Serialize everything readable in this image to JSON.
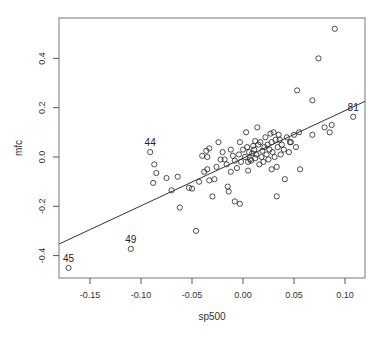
{
  "chart_data": {
    "type": "scatter",
    "title": "",
    "xlabel": "sp500",
    "ylabel": "mfc",
    "xlim": [
      -0.18,
      0.12
    ],
    "ylim": [
      -0.49,
      0.56
    ],
    "grid": false,
    "legend": null,
    "x_ticks": [
      -0.15,
      -0.1,
      -0.05,
      0.0,
      0.05,
      0.1
    ],
    "x_tick_labels": [
      "-0.15",
      "-0.10",
      "-0.05",
      "0.00",
      "0.05",
      "0.10"
    ],
    "y_ticks": [
      -0.4,
      -0.2,
      0.0,
      0.2,
      0.4
    ],
    "y_tick_labels": [
      "-0.4",
      "-0.2",
      "0.0",
      "0.2",
      "0.4"
    ],
    "regression_line": {
      "intercept": -0.005,
      "slope": 1.93,
      "x_range": [
        -0.18,
        0.12
      ]
    },
    "annotations": [
      {
        "label": "45",
        "x": -0.171,
        "y": -0.45
      },
      {
        "label": "49",
        "x": -0.11,
        "y": -0.373
      },
      {
        "label": "44",
        "x": -0.091,
        "y": 0.02
      },
      {
        "label": "81",
        "x": 0.108,
        "y": 0.163
      }
    ],
    "points": [
      [
        -0.171,
        -0.45
      ],
      [
        -0.11,
        -0.373
      ],
      [
        -0.091,
        0.02
      ],
      [
        -0.087,
        -0.03
      ],
      [
        -0.085,
        -0.065
      ],
      [
        -0.088,
        -0.105
      ],
      [
        -0.075,
        -0.085
      ],
      [
        -0.07,
        -0.135
      ],
      [
        -0.062,
        -0.205
      ],
      [
        -0.064,
        -0.08
      ],
      [
        -0.053,
        -0.125
      ],
      [
        -0.05,
        -0.128
      ],
      [
        -0.046,
        -0.3
      ],
      [
        -0.043,
        -0.1
      ],
      [
        -0.038,
        -0.06
      ],
      [
        -0.035,
        -0.05
      ],
      [
        -0.033,
        -0.095
      ],
      [
        -0.03,
        -0.16
      ],
      [
        -0.036,
        0.025
      ],
      [
        -0.035,
        0.0
      ],
      [
        -0.033,
        0.035
      ],
      [
        -0.028,
        -0.09
      ],
      [
        -0.026,
        -0.04
      ],
      [
        -0.022,
        -0.01
      ],
      [
        -0.02,
        0.02
      ],
      [
        -0.018,
        -0.01
      ],
      [
        -0.016,
        -0.03
      ],
      [
        -0.015,
        -0.12
      ],
      [
        -0.014,
        -0.14
      ],
      [
        -0.012,
        0.03
      ],
      [
        -0.01,
        0.005
      ],
      [
        -0.008,
        -0.015
      ],
      [
        -0.006,
        -0.045
      ],
      [
        -0.004,
        0.01
      ],
      [
        -0.003,
        0.06
      ],
      [
        -0.002,
        -0.02
      ],
      [
        -0.008,
        -0.18
      ],
      [
        -0.003,
        -0.19
      ],
      [
        0.0,
        0.03
      ],
      [
        0.002,
        0.0
      ],
      [
        0.003,
        0.1
      ],
      [
        0.004,
        0.04
      ],
      [
        0.005,
        -0.02
      ],
      [
        0.006,
        0.02
      ],
      [
        0.007,
        -0.01
      ],
      [
        0.008,
        -0.015
      ],
      [
        0.009,
        0.015
      ],
      [
        0.01,
        0.045
      ],
      [
        0.011,
        0.03
      ],
      [
        0.012,
        -0.005
      ],
      [
        0.013,
        0.01
      ],
      [
        0.014,
        0.12
      ],
      [
        0.015,
        0.05
      ],
      [
        0.016,
        -0.03
      ],
      [
        0.017,
        0.06
      ],
      [
        0.018,
        0.0
      ],
      [
        0.019,
        0.025
      ],
      [
        0.02,
        -0.02
      ],
      [
        0.021,
        0.04
      ],
      [
        0.022,
        0.08
      ],
      [
        0.023,
        0.01
      ],
      [
        0.024,
        0.05
      ],
      [
        0.025,
        -0.01
      ],
      [
        0.026,
        0.03
      ],
      [
        0.027,
        0.095
      ],
      [
        0.028,
        0.06
      ],
      [
        0.029,
        0.02
      ],
      [
        0.03,
        0.1
      ],
      [
        0.031,
        0.0
      ],
      [
        0.032,
        0.07
      ],
      [
        0.033,
        -0.04
      ],
      [
        0.034,
        0.04
      ],
      [
        0.035,
        0.09
      ],
      [
        0.037,
        0.01
      ],
      [
        0.038,
        0.05
      ],
      [
        0.04,
        0.03
      ],
      [
        0.041,
        -0.09
      ],
      [
        0.043,
        0.08
      ],
      [
        0.045,
        0.02
      ],
      [
        0.047,
        0.06
      ],
      [
        0.05,
        0.09
      ],
      [
        0.052,
        0.04
      ],
      [
        0.055,
        0.1
      ],
      [
        0.056,
        -0.05
      ],
      [
        0.033,
        -0.16
      ],
      [
        0.053,
        0.27
      ],
      [
        0.068,
        0.23
      ],
      [
        0.074,
        0.4
      ],
      [
        0.09,
        0.52
      ],
      [
        0.068,
        0.09
      ],
      [
        0.08,
        0.12
      ],
      [
        0.085,
        0.1
      ],
      [
        0.087,
        0.13
      ],
      [
        0.108,
        0.163
      ],
      [
        0.046,
        0.06
      ],
      [
        0.012,
        0.065
      ],
      [
        -0.024,
        0.06
      ],
      [
        -0.012,
        -0.06
      ],
      [
        0.005,
        -0.055
      ],
      [
        0.028,
        -0.05
      ],
      [
        -0.04,
        0.005
      ],
      [
        0.036,
        0.07
      ]
    ]
  },
  "axes": {
    "xlabel": "sp500",
    "ylabel": "mfc"
  }
}
